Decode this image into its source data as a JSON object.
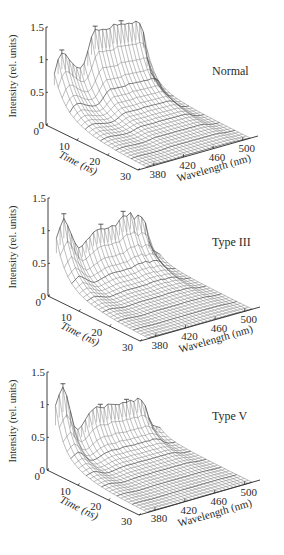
{
  "figure": {
    "panel_count": 3
  },
  "chart_data": [
    {
      "type": "surface3d",
      "title": "Normal",
      "xlabel": "Wavelength (nm)",
      "ylabel": "Time (ns)",
      "zlabel": "Intensity (rel. units)",
      "x_ticks": [
        380,
        420,
        460,
        500
      ],
      "y_ticks": [
        0,
        10,
        20,
        30
      ],
      "z_ticks": [
        "0",
        "0.5",
        "1",
        "1.5"
      ],
      "xlim": [
        370,
        510
      ],
      "ylim": [
        0,
        30
      ],
      "zlim": [
        0,
        1.5
      ],
      "grid": false,
      "wavelength": [
        370,
        375,
        380,
        385,
        390,
        395,
        400,
        405,
        410,
        415,
        420,
        425,
        430,
        435,
        440,
        445,
        450,
        455,
        460,
        465,
        470,
        475,
        480,
        485,
        490,
        495,
        500,
        505,
        510
      ],
      "intensity_t0": [
        0.75,
        0.95,
        1.03,
        1.0,
        0.9,
        0.82,
        0.75,
        0.72,
        0.78,
        0.95,
        1.15,
        1.25,
        1.22,
        1.22,
        1.2,
        1.2,
        1.25,
        1.22,
        1.22,
        1.2,
        1.2,
        1.18,
        1.2,
        1.15,
        1.0,
        0.6,
        0.35,
        0.25,
        0.2
      ],
      "decay_ns_short": 3.0,
      "decay_ns_long": 9.0,
      "error_bar_wavelengths": [
        382,
        427,
        462
      ],
      "error_bar_value": 0.05
    },
    {
      "type": "surface3d",
      "title": "Type III",
      "xlabel": "Wavelength (nm)",
      "ylabel": "Time (ns)",
      "zlabel": "Intensity (rel. units)",
      "x_ticks": [
        380,
        420,
        460,
        500
      ],
      "y_ticks": [
        0,
        10,
        20,
        30
      ],
      "z_ticks": [
        "0",
        "0.5",
        "1",
        "1.5"
      ],
      "xlim": [
        370,
        510
      ],
      "ylim": [
        0,
        30
      ],
      "zlim": [
        0,
        1.5
      ],
      "grid": false,
      "wavelength": [
        370,
        375,
        380,
        385,
        390,
        395,
        400,
        405,
        410,
        415,
        420,
        425,
        430,
        435,
        440,
        445,
        450,
        455,
        460,
        465,
        470,
        475,
        480,
        485,
        490,
        495,
        500,
        505,
        510
      ],
      "intensity_t0": [
        0.85,
        1.0,
        1.12,
        1.0,
        0.85,
        0.7,
        0.6,
        0.62,
        0.68,
        0.72,
        0.78,
        0.8,
        0.8,
        0.78,
        0.78,
        0.8,
        0.78,
        0.85,
        0.9,
        0.88,
        0.92,
        0.8,
        0.85,
        0.8,
        0.7,
        0.4,
        0.25,
        0.2,
        0.15
      ],
      "decay_ns_short": 2.5,
      "decay_ns_long": 8.0,
      "error_bar_wavelengths": [
        382,
        428,
        462
      ],
      "error_bar_value": 0.07
    },
    {
      "type": "surface3d",
      "title": "Type V",
      "xlabel": "Wavelength (nm)",
      "ylabel": "Time (ns)",
      "zlabel": "Intensity (rel. units)",
      "x_ticks": [
        380,
        420,
        460,
        500
      ],
      "y_ticks": [
        0,
        10,
        20,
        30
      ],
      "z_ticks": [
        "0",
        "0.5",
        "1",
        "1.5"
      ],
      "xlim": [
        370,
        510
      ],
      "ylim": [
        0,
        30
      ],
      "zlim": [
        0,
        1.5
      ],
      "grid": false,
      "wavelength": [
        370,
        375,
        380,
        385,
        390,
        395,
        400,
        405,
        410,
        415,
        420,
        425,
        430,
        435,
        440,
        445,
        450,
        455,
        460,
        465,
        470,
        475,
        480,
        485,
        490,
        495,
        500,
        505,
        510
      ],
      "intensity_t0": [
        0.95,
        1.1,
        1.2,
        1.05,
        0.8,
        0.55,
        0.48,
        0.52,
        0.6,
        0.68,
        0.72,
        0.75,
        0.72,
        0.7,
        0.74,
        0.72,
        0.7,
        0.68,
        0.7,
        0.68,
        0.7,
        0.66,
        0.7,
        0.65,
        0.55,
        0.35,
        0.22,
        0.18,
        0.15
      ],
      "decay_ns_short": 2.0,
      "decay_ns_long": 7.0,
      "error_bar_wavelengths": [
        382,
        430,
        464
      ],
      "error_bar_value": 0.05
    }
  ],
  "panels": [
    {
      "title": "Normal",
      "origin": [
        46,
        125
      ],
      "time_end": [
        138,
        170
      ],
      "wave_end": [
        258,
        136
      ],
      "z_height": 98,
      "label_pos": [
        212,
        75
      ]
    },
    {
      "title": "Type III",
      "origin": [
        48,
        296
      ],
      "time_end": [
        140,
        341
      ],
      "wave_end": [
        260,
        307
      ],
      "z_height": 98,
      "label_pos": [
        212,
        246
      ]
    },
    {
      "title": "Type V",
      "origin": [
        47,
        470
      ],
      "time_end": [
        139,
        515
      ],
      "wave_end": [
        260,
        480
      ],
      "z_height": 98,
      "label_pos": [
        212,
        420
      ]
    }
  ],
  "colors": {
    "mesh": "#6f6f6f",
    "axis": "#2a2a2a",
    "text": "#2a2a2a"
  }
}
